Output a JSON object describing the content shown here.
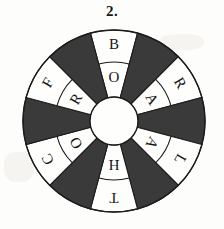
{
  "puzzle": {
    "number_label": "2.",
    "type": "word-wheel",
    "sector_count": 12,
    "sector_degrees": 30,
    "ring_count": 2,
    "colors": {
      "dark_sector": "#3a3a3a",
      "light_sector": "#fefefc",
      "outline": "#1b1b1b",
      "page_background": "#fdfdfb",
      "text": "#141414"
    },
    "geometry": {
      "center_x": 114,
      "center_y": 121,
      "outer_radius": 91,
      "ring_divider_radius": 59,
      "hub_radius": 24
    },
    "cells": [
      {
        "index": 0,
        "angle_deg": 0,
        "fill": "light",
        "outer_letter": "B",
        "inner_letter": "O"
      },
      {
        "index": 1,
        "angle_deg": 30,
        "fill": "dark",
        "outer_letter": "",
        "inner_letter": ""
      },
      {
        "index": 2,
        "angle_deg": 60,
        "fill": "light",
        "outer_letter": "R",
        "inner_letter": "A"
      },
      {
        "index": 3,
        "angle_deg": 90,
        "fill": "dark",
        "outer_letter": "",
        "inner_letter": ""
      },
      {
        "index": 4,
        "angle_deg": 120,
        "fill": "light",
        "outer_letter": "L",
        "inner_letter": "A"
      },
      {
        "index": 5,
        "angle_deg": 150,
        "fill": "dark",
        "outer_letter": "",
        "inner_letter": ""
      },
      {
        "index": 6,
        "angle_deg": 180,
        "fill": "light",
        "outer_letter": "T",
        "inner_letter": "H"
      },
      {
        "index": 7,
        "angle_deg": 210,
        "fill": "dark",
        "outer_letter": "",
        "inner_letter": ""
      },
      {
        "index": 8,
        "angle_deg": 240,
        "fill": "light",
        "outer_letter": "C",
        "inner_letter": "O"
      },
      {
        "index": 9,
        "angle_deg": 270,
        "fill": "dark",
        "outer_letter": "",
        "inner_letter": ""
      },
      {
        "index": 10,
        "angle_deg": 300,
        "fill": "light",
        "outer_letter": "F",
        "inner_letter": "R"
      },
      {
        "index": 11,
        "angle_deg": 330,
        "fill": "dark",
        "outer_letter": "",
        "inner_letter": ""
      }
    ],
    "outer_ring_letters_clockwise": [
      "B",
      "R",
      "L",
      "T",
      "C",
      "F"
    ],
    "inner_ring_letters_clockwise": [
      "O",
      "A",
      "A",
      "H",
      "O",
      "R"
    ]
  }
}
